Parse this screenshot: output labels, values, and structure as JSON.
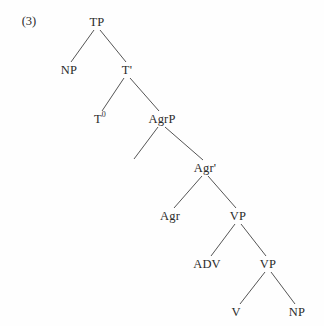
{
  "figure": {
    "example_number": "(3)",
    "example_number_x": 29,
    "example_number_y": 21,
    "width": 324,
    "height": 326,
    "background_color": "#fefefe",
    "line_color": "#555555",
    "text_color": "#2b2b2b"
  },
  "tree": {
    "type": "syntax-tree",
    "description": "X-bar phrase structure tree: TP dominating NP and T-bar, with AgrP, Agr-bar, VP shell containing ADV and inner VP with V and NP.",
    "nodes": [
      {
        "id": "tp",
        "label": "TP",
        "sup": "",
        "x": 97,
        "y": 22
      },
      {
        "id": "np1",
        "label": "NP",
        "sup": "",
        "x": 69,
        "y": 70
      },
      {
        "id": "tbar",
        "label": "T'",
        "sup": "",
        "x": 127,
        "y": 70
      },
      {
        "id": "t0",
        "label": "T",
        "sup": "0",
        "x": 100,
        "y": 119
      },
      {
        "id": "agrp",
        "label": "AgrP",
        "sup": "",
        "x": 162,
        "y": 119
      },
      {
        "id": "spec",
        "label": "",
        "sup": "",
        "x": 137,
        "y": 160
      },
      {
        "id": "agrbar",
        "label": "Agr'",
        "sup": "",
        "x": 205,
        "y": 168
      },
      {
        "id": "agr",
        "label": "Agr",
        "sup": "",
        "x": 170,
        "y": 216
      },
      {
        "id": "vp1",
        "label": "VP",
        "sup": "",
        "x": 238,
        "y": 216
      },
      {
        "id": "adv",
        "label": "ADV",
        "sup": "",
        "x": 207,
        "y": 264
      },
      {
        "id": "vp2",
        "label": "VP",
        "sup": "",
        "x": 268,
        "y": 264
      },
      {
        "id": "v",
        "label": "V",
        "sup": "",
        "x": 236,
        "y": 312
      },
      {
        "id": "np2",
        "label": "NP",
        "sup": "",
        "x": 297,
        "y": 312
      }
    ],
    "edges": [
      {
        "from": "tp",
        "to": "np1",
        "x1": 94,
        "y1": 30,
        "x2": 71,
        "y2": 62
      },
      {
        "from": "tp",
        "to": "tbar",
        "x1": 100,
        "y1": 30,
        "x2": 126,
        "y2": 62
      },
      {
        "from": "tbar",
        "to": "t0",
        "x1": 124,
        "y1": 78,
        "x2": 102,
        "y2": 111
      },
      {
        "from": "tbar",
        "to": "agrp",
        "x1": 130,
        "y1": 78,
        "x2": 159,
        "y2": 111
      },
      {
        "from": "agrp",
        "to": "spec",
        "x1": 158,
        "y1": 127,
        "x2": 134,
        "y2": 159
      },
      {
        "from": "agrp",
        "to": "agrbar",
        "x1": 165,
        "y1": 127,
        "x2": 203,
        "y2": 160
      },
      {
        "from": "agrbar",
        "to": "agr",
        "x1": 202,
        "y1": 176,
        "x2": 174,
        "y2": 208
      },
      {
        "from": "agrbar",
        "to": "vp1",
        "x1": 208,
        "y1": 176,
        "x2": 236,
        "y2": 208
      },
      {
        "from": "vp1",
        "to": "adv",
        "x1": 235,
        "y1": 224,
        "x2": 211,
        "y2": 256
      },
      {
        "from": "vp1",
        "to": "vp2",
        "x1": 241,
        "y1": 224,
        "x2": 266,
        "y2": 256
      },
      {
        "from": "vp2",
        "to": "v",
        "x1": 265,
        "y1": 272,
        "x2": 240,
        "y2": 304
      },
      {
        "from": "vp2",
        "to": "np2",
        "x1": 271,
        "y1": 272,
        "x2": 295,
        "y2": 304
      }
    ]
  }
}
